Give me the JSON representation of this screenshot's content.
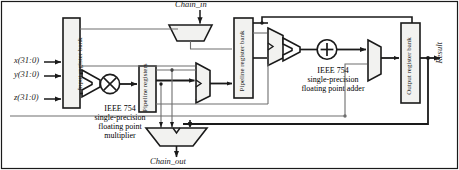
{
  "figure": {
    "type": "block-diagram"
  },
  "inputs": {
    "x": "x(31:0)",
    "y": "y(31:0)",
    "z": "z(31:0)"
  },
  "chain": {
    "in": "Chain_in",
    "out": "Chain_out"
  },
  "output": {
    "result": "Result"
  },
  "blocks": {
    "input_register_bank": "Input register bank",
    "pipeline_registers": "Pipeline registers",
    "pipeline_register_bank": "Pipeline register bank",
    "output_register_bank": "Output register bank"
  },
  "captions": {
    "multiplier": {
      "line1": "IEEE 754",
      "line2": "single-precision",
      "line3": "floating point",
      "line4": "multiplier"
    },
    "adder": {
      "line1": "IEEE 754",
      "line2": "single-precision",
      "line3": "floating point adder"
    }
  },
  "operators": {
    "multiply": "×",
    "add": "+"
  },
  "colors": {
    "line": "#1a1a1a",
    "thin_line": "#6e6e6e",
    "fill": "#f2f2f0",
    "background": "#ffffff",
    "text": "#1a1a1a"
  }
}
